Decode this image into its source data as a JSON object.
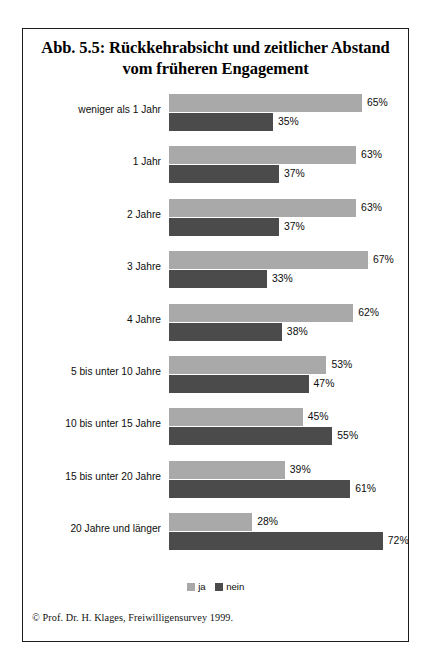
{
  "figure": {
    "title_line_1": "Abb. 5.5: Rückkehrabsicht und zeitlicher Abstand",
    "title_line_2": "vom früheren Engagement",
    "source_note": "© Prof. Dr. H. Klages, Freiwilligensurvey 1999."
  },
  "colors": {
    "series_ja": "#a9a9a9",
    "series_nein": "#4b4b4b",
    "frame": "#1c1c1c",
    "background": "#ffffff",
    "text": "#0d0d0d"
  },
  "legend": {
    "items": [
      {
        "label": "ja",
        "swatch": "ja"
      },
      {
        "label": "nein",
        "swatch": "nein"
      }
    ]
  },
  "chart_data": {
    "type": "bar",
    "orientation": "horizontal",
    "title": "Abb. 5.5: Rückkehrabsicht und zeitlicher Abstand vom früheren Engagement",
    "xlabel": "",
    "ylabel": "",
    "xlim": [
      0,
      100
    ],
    "grid": false,
    "legend_position": "bottom-center",
    "value_suffix": "%",
    "categories": [
      "weniger als 1 Jahr",
      "1 Jahr",
      "2 Jahre",
      "3 Jahre",
      "4 Jahre",
      "5 bis unter 10 Jahre",
      "10 bis unter 15 Jahre",
      "15 bis unter 20 Jahre",
      "20 Jahre und länger"
    ],
    "series": [
      {
        "name": "ja",
        "color": "#a9a9a9",
        "values": [
          65,
          63,
          63,
          67,
          62,
          53,
          45,
          39,
          28
        ],
        "labels": [
          "65%",
          "63%",
          "63%",
          "67%",
          "62%",
          "53%",
          "45%",
          "39%",
          "28%"
        ]
      },
      {
        "name": "nein",
        "color": "#4b4b4b",
        "values": [
          35,
          37,
          37,
          33,
          38,
          47,
          55,
          61,
          72
        ],
        "labels": [
          "35%",
          "37%",
          "37%",
          "33%",
          "38%",
          "47%",
          "55%",
          "61%",
          "72%"
        ]
      }
    ]
  }
}
